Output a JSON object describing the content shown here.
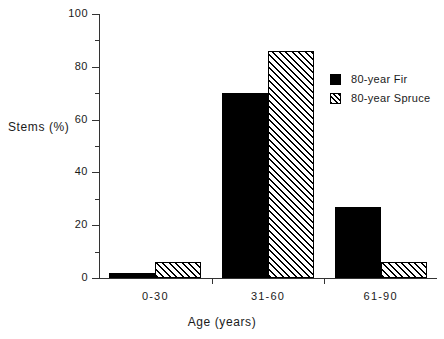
{
  "chart_data": {
    "type": "bar",
    "title": "",
    "xlabel": "Age  (years)",
    "ylabel": "Stems  (%)",
    "categories": [
      "0-30",
      "31-60",
      "61-90"
    ],
    "series": [
      {
        "name": "80-year  Fir",
        "fill": "solid",
        "color": "#000000",
        "values": [
          2,
          70,
          27
        ]
      },
      {
        "name": "80-year  Spruce",
        "fill": "hatch",
        "color": "#000000",
        "values": [
          6,
          86,
          6
        ]
      }
    ],
    "ylim": [
      0,
      100
    ],
    "ytick_labels": [
      "0",
      "20",
      "40",
      "60",
      "80",
      "100"
    ],
    "ytick_values": [
      0,
      20,
      40,
      60,
      80,
      100
    ],
    "yminor_values": [
      10,
      30,
      50,
      70,
      90
    ],
    "grid": false,
    "legend_position": "upper right",
    "legend": [
      {
        "swatch": "solid",
        "age": "80-year",
        "species": "Fir"
      },
      {
        "swatch": "hatch",
        "age": "80-year",
        "species": "Spruce"
      }
    ]
  }
}
